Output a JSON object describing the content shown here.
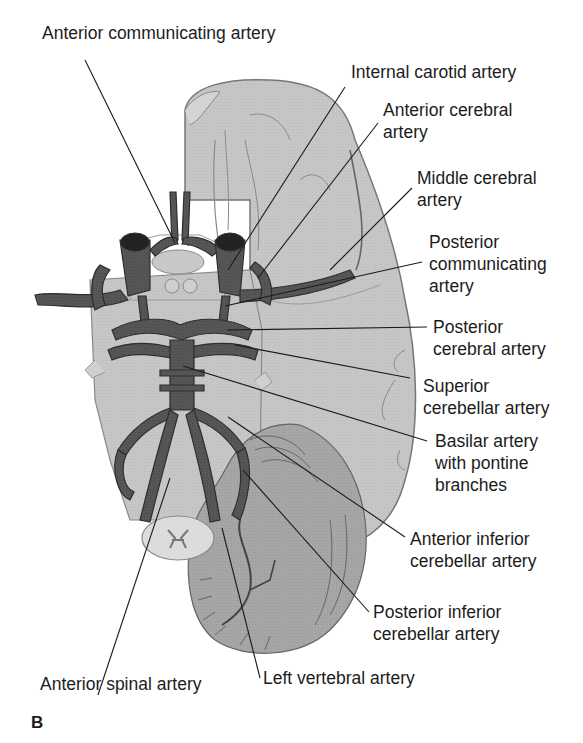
{
  "figure": {
    "panel_letter": "B",
    "colors": {
      "background": "#ffffff",
      "brain_fill": "#c4c4c4",
      "brain_light": "#d6d6d6",
      "brain_outline": "#7a7a7a",
      "cerebellum_fill": "#a9a9a9",
      "artery_fill": "#555555",
      "artery_outline": "#2e2e2e",
      "leader_line": "#1a1a1a",
      "text": "#1c1c1c"
    },
    "labels": [
      {
        "id": "anterior-communicating-artery",
        "text": "Anterior communicating artery"
      },
      {
        "id": "internal-carotid-artery",
        "text": "Internal carotid artery"
      },
      {
        "id": "anterior-cerebral-artery",
        "text": "Anterior cerebral\nartery"
      },
      {
        "id": "middle-cerebral-artery",
        "text": "Middle cerebral\nartery"
      },
      {
        "id": "posterior-communicating-artery",
        "text": "Posterior\ncommunicating\nartery"
      },
      {
        "id": "posterior-cerebral-artery",
        "text": "Posterior\ncerebral artery"
      },
      {
        "id": "superior-cerebellar-artery",
        "text": "Superior\ncerebellar artery"
      },
      {
        "id": "basilar-artery",
        "text": "Basilar artery\nwith pontine\nbranches"
      },
      {
        "id": "anterior-inferior-cerebellar-artery",
        "text": "Anterior inferior\ncerebellar artery"
      },
      {
        "id": "posterior-inferior-cerebellar-artery",
        "text": "Posterior inferior\ncerebellar artery"
      },
      {
        "id": "left-vertebral-artery",
        "text": "Left vertebral artery"
      },
      {
        "id": "anterior-spinal-artery",
        "text": "Anterior spinal artery"
      }
    ]
  }
}
